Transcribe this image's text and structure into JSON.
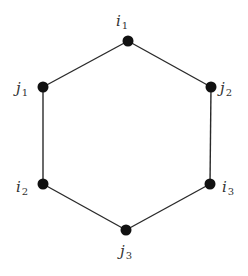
{
  "diagram": {
    "type": "hexagon-graph",
    "colors": {
      "node": "#111111",
      "edge": "#2a2a2a",
      "label": "#333333",
      "background": "#ffffff"
    },
    "nodes": [
      {
        "id": "i1",
        "base": "i",
        "sub": "1",
        "x": 128,
        "y": 41,
        "lx": 122,
        "ly": 26,
        "anchor": "middle"
      },
      {
        "id": "j2",
        "base": "j",
        "sub": "2",
        "x": 211,
        "y": 87,
        "lx": 220,
        "ly": 93,
        "anchor": "start"
      },
      {
        "id": "i3",
        "base": "i",
        "sub": "3",
        "x": 210,
        "y": 184,
        "lx": 222,
        "ly": 192,
        "anchor": "start"
      },
      {
        "id": "j3",
        "base": "j",
        "sub": "3",
        "x": 126,
        "y": 230,
        "lx": 126,
        "ly": 256,
        "anchor": "middle"
      },
      {
        "id": "i2",
        "base": "i",
        "sub": "2",
        "x": 43,
        "y": 184,
        "lx": 16,
        "ly": 192,
        "anchor": "start"
      },
      {
        "id": "j1",
        "base": "j",
        "sub": "1",
        "x": 43,
        "y": 87,
        "lx": 16,
        "ly": 93,
        "anchor": "start"
      }
    ],
    "edges": [
      [
        "i1",
        "j2"
      ],
      [
        "j2",
        "i3"
      ],
      [
        "i3",
        "j3"
      ],
      [
        "j3",
        "i2"
      ],
      [
        "i2",
        "j1"
      ],
      [
        "j1",
        "i1"
      ]
    ]
  }
}
